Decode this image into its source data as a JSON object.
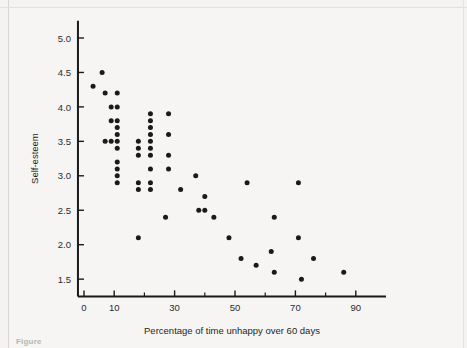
{
  "figure": {
    "caption_partial": "Figure"
  },
  "chart_data": {
    "type": "scatter",
    "title": "",
    "xlabel": "Percentage of time unhappy over 60 days",
    "ylabel": "Self-esteem",
    "xlim": [
      -2,
      100
    ],
    "ylim": [
      1.25,
      5.25
    ],
    "xticks": [
      0,
      10,
      30,
      50,
      70,
      90
    ],
    "xticklabels": [
      "0",
      "10",
      "30",
      "50",
      "70",
      "90"
    ],
    "xminorticks": [
      20,
      40,
      60,
      80
    ],
    "yticks": [
      1.5,
      2.0,
      2.5,
      3.0,
      3.5,
      4.0,
      4.5,
      5.0
    ],
    "yticklabels": [
      "1.5",
      "2.0",
      "2.5",
      "3.0",
      "3.5",
      "4.0",
      "4.5",
      "5.0"
    ],
    "grid": false,
    "legend": null,
    "marker": {
      "shape": "circle",
      "color": "#1a1a1a",
      "size_px": 5
    },
    "axis_color": "#1a1a1a",
    "background_color": "#f6f5f3",
    "n_points": 64,
    "points": [
      [
        3,
        4.3
      ],
      [
        6,
        4.5
      ],
      [
        7,
        4.2
      ],
      [
        7,
        3.5
      ],
      [
        9,
        4.0
      ],
      [
        9,
        3.8
      ],
      [
        9,
        3.5
      ],
      [
        11,
        4.2
      ],
      [
        11,
        4.0
      ],
      [
        11,
        3.8
      ],
      [
        11,
        3.7
      ],
      [
        11,
        3.6
      ],
      [
        11,
        3.5
      ],
      [
        11,
        3.4
      ],
      [
        11,
        3.2
      ],
      [
        11,
        3.1
      ],
      [
        11,
        3.0
      ],
      [
        11,
        2.9
      ],
      [
        18,
        3.5
      ],
      [
        18,
        3.4
      ],
      [
        18,
        3.3
      ],
      [
        18,
        2.9
      ],
      [
        18,
        2.8
      ],
      [
        18,
        2.1
      ],
      [
        22,
        3.9
      ],
      [
        22,
        3.8
      ],
      [
        22,
        3.7
      ],
      [
        22,
        3.6
      ],
      [
        22,
        3.5
      ],
      [
        22,
        3.4
      ],
      [
        22,
        3.3
      ],
      [
        22,
        3.1
      ],
      [
        22,
        2.9
      ],
      [
        22,
        2.8
      ],
      [
        27,
        2.4
      ],
      [
        28,
        3.9
      ],
      [
        28,
        3.6
      ],
      [
        28,
        3.3
      ],
      [
        28,
        3.1
      ],
      [
        32,
        2.8
      ],
      [
        37,
        3.0
      ],
      [
        38,
        2.5
      ],
      [
        40,
        2.7
      ],
      [
        40,
        2.5
      ],
      [
        43,
        2.4
      ],
      [
        48,
        2.1
      ],
      [
        52,
        1.8
      ],
      [
        54,
        2.9
      ],
      [
        57,
        1.7
      ],
      [
        62,
        1.9
      ],
      [
        63,
        2.4
      ],
      [
        63,
        1.6
      ],
      [
        71,
        2.9
      ],
      [
        71,
        2.1
      ],
      [
        72,
        1.5
      ],
      [
        76,
        1.8
      ],
      [
        86,
        1.6
      ]
    ]
  }
}
